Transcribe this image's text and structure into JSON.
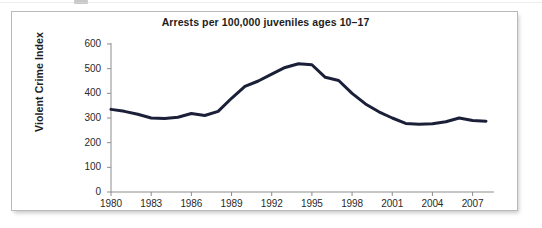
{
  "chart_data": {
    "type": "line",
    "title": "Arrests per 100,000 juveniles ages 10–17",
    "xlabel": "",
    "ylabel": "Violent Crime Index",
    "xlim": [
      1980,
      2008
    ],
    "ylim": [
      0,
      600
    ],
    "grid": false,
    "legend": null,
    "line_color": "#1b2038",
    "x": [
      1980,
      1981,
      1982,
      1983,
      1984,
      1985,
      1986,
      1987,
      1988,
      1989,
      1990,
      1991,
      1992,
      1993,
      1994,
      1995,
      1996,
      1997,
      1998,
      1999,
      2000,
      2001,
      2002,
      2003,
      2004,
      2005,
      2006,
      2007,
      2008
    ],
    "values": [
      335,
      327,
      315,
      300,
      298,
      303,
      318,
      310,
      327,
      380,
      428,
      450,
      478,
      505,
      520,
      516,
      465,
      452,
      400,
      357,
      325,
      300,
      278,
      275,
      277,
      285,
      300,
      290,
      287
    ],
    "y_ticks": [
      0,
      100,
      200,
      300,
      400,
      500,
      600
    ],
    "x_ticks": [
      1980,
      1983,
      1986,
      1989,
      1992,
      1995,
      1998,
      2001,
      2004,
      2007
    ],
    "y_tick_labels": [
      "0",
      "100",
      "200",
      "300",
      "400",
      "500",
      "600"
    ],
    "x_tick_labels": [
      "1980",
      "1983",
      "1986",
      "1989",
      "1992",
      "1995",
      "1998",
      "2001",
      "2004",
      "2007"
    ]
  },
  "colors": {
    "line": "#1b2038",
    "axis": "#8d8d8d",
    "frame": "#b9b9b9",
    "text": "#1d1d1d",
    "background": "#ffffff"
  }
}
